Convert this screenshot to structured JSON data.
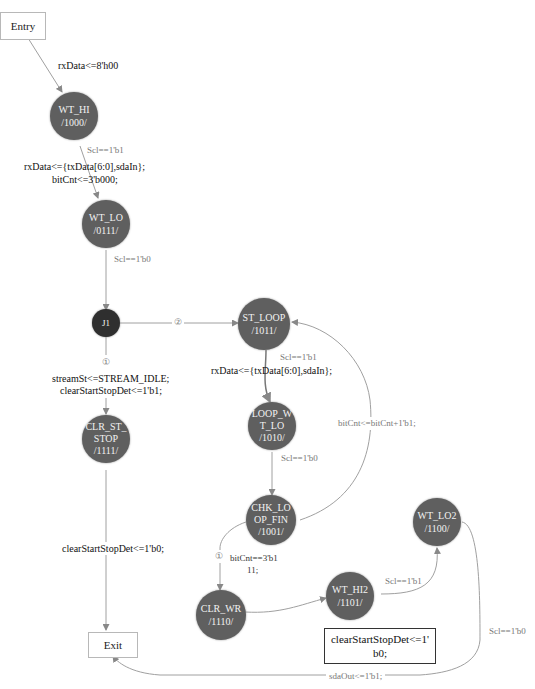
{
  "terminals": {
    "entry": "Entry",
    "exit": "Exit"
  },
  "nodes": {
    "wt_hi": {
      "name": "WT_HI",
      "code": "/1000/"
    },
    "wt_lo": {
      "name": "WT_LO",
      "code": "/0111/"
    },
    "j1": {
      "name": "J1"
    },
    "clr_st_stop": {
      "name_line1": "CLR_ST_",
      "name_line2": "STOP",
      "code": "/1111/"
    },
    "st_loop": {
      "name": "ST_LOOP",
      "code": "/1011/"
    },
    "loop_wt_lo": {
      "name_line1": "LOOP_W",
      "name_line2": "T_LO",
      "code": "/1010/"
    },
    "chk_loop_fin": {
      "name_line1": "CHK_LO",
      "name_line2": "OP_FIN",
      "code": "/1001/"
    },
    "clr_wr": {
      "name": "CLR_WR",
      "code": "/1110/"
    },
    "wt_hi2": {
      "name": "WT_HI2",
      "code": "/1101/"
    },
    "wt_lo2": {
      "name": "WT_LO2",
      "code": "/1100/"
    }
  },
  "edges": {
    "entry_to_wt_hi": "rxData<=8'h00",
    "wt_hi_cond": "Scl==1'b1",
    "wt_hi_action_1": "rxData<={txData[6:0],sdaIn};",
    "wt_hi_action_2": "bitCnt<=3'b000;",
    "wt_lo_cond": "Scl==1'b0",
    "j1_branch_2": "②",
    "j1_branch_1": "①",
    "j1_action_1": "streamSt<=STREAM_IDLE;",
    "j1_action_2": "clearStartStopDet<=1'b1;",
    "clr_st_stop_action": "clearStartStopDet<=1'b0;",
    "st_loop_cond": "Scl==1'b1",
    "st_loop_action": "rxData<={txData[6:0],sdaIn};",
    "loop_wt_lo_cond": "Scl==1'b0",
    "loop_back_action": "bitCnt<=bitCnt+1'b1;",
    "chk_branch_1": "①",
    "chk_cond_1": "bitCnt==3'b1",
    "chk_cond_2": "11;",
    "wt_hi2_cond": "Scl==1'b1",
    "wt_lo2_cond": "Scl==1'b0",
    "exit_action": "sdaOut<=1'b1;"
  },
  "note": {
    "line1": "clearStartStopDet<=1'",
    "line2": "b0;"
  },
  "colors": {
    "node_fill": "#5f5f5f",
    "junction_fill": "#2f2f2f",
    "edge": "#9a9a9a"
  }
}
